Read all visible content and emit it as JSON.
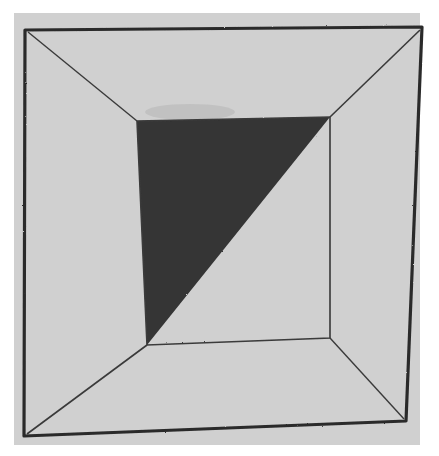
{
  "image": {
    "description": "Hand-drawn square frame in perspective with an inner square whose upper-left half is filled with a dark triangle",
    "colors": {
      "background": "#ffffff",
      "paper": "#d0d0d0",
      "ink": "#2a2a2a",
      "fill": "#353535"
    },
    "outer_square": [
      [
        25,
        30
      ],
      [
        422,
        27
      ],
      [
        406,
        421
      ],
      [
        24,
        436
      ]
    ],
    "inner_square": [
      [
        137,
        121
      ],
      [
        330,
        117
      ],
      [
        330,
        338
      ],
      [
        147,
        345
      ]
    ],
    "dark_triangle": [
      [
        137,
        121
      ],
      [
        330,
        117
      ],
      [
        147,
        345
      ]
    ]
  }
}
